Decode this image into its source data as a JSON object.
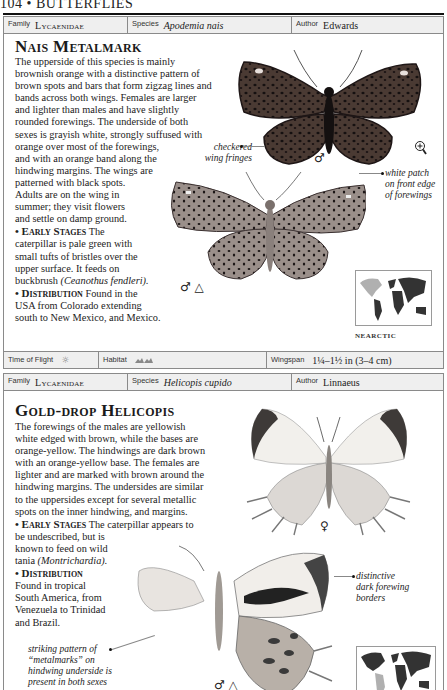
{
  "page": {
    "header": "104 • BUTTERFLIES"
  },
  "entries": [
    {
      "meta": {
        "family_label": "Family",
        "family": "Lycaenidae",
        "species_label": "Species",
        "species": "Apodemia nais",
        "author_label": "Author",
        "author": "Edwards"
      },
      "title": "Nais Metalmark",
      "description": [
        "The upperside of this species is mainly",
        "brownish orange with a distinctive pattern of",
        "brown spots and bars that form zigzag lines and",
        "bands across both wings. Females are larger",
        "and lighter than males and have slightly",
        "rounded forewings. The underside of both",
        "sexes is grayish white, strongly suffused with",
        "orange over most of the forewings,",
        "and with an orange band along the",
        "hindwing margins. The wings are",
        "patterned with black spots.",
        "Adults are on the wing in",
        "summer; they visit flowers",
        "and settle on damp ground."
      ],
      "early_stages": {
        "heading": "• Early Stages",
        "lines": [
          " The",
          "caterpillar is pale green with",
          "small tufts of bristles over the",
          "upper surface. It feeds on",
          "buckbrush "
        ],
        "italic": "(Ceanothus fendleri)."
      },
      "distribution": {
        "heading": "• Distribution",
        "lines": [
          " Found in the",
          "USA from Colorado extending",
          "south to New Mexico, and Mexico."
        ]
      },
      "annotations": {
        "wing_fringes": [
          "checkered",
          "wing fringes"
        ],
        "white_patch": [
          "white patch",
          "on front edge",
          "of forewings"
        ]
      },
      "symbols": {
        "upper": "♂",
        "lower": "♂ △",
        "magnify": "magnify-icon"
      },
      "map_label": "NEARCTIC",
      "footer": {
        "time_label": "Time of Flight",
        "time_icon": "☼",
        "habitat_label": "Habitat",
        "habitat_icon": "ᨏᨏ",
        "wingspan_label": "Wingspan",
        "wingspan": "1¼–1½ in (3–4 cm)"
      }
    },
    {
      "meta": {
        "family_label": "Family",
        "family": "Lycaenidae",
        "species_label": "Species",
        "species": "Helicopis cupido",
        "author_label": "Author",
        "author": "Linnaeus"
      },
      "title": "Gold-drop Helicopis",
      "description": [
        "The forewings of the males are yellowish",
        "white edged with brown, while the bases are",
        "orange-yellow. The hindwings are dark brown",
        "with an orange-yellow base. The females are",
        "lighter and are marked with brown around the",
        "hindwing margins. The undersides are similar",
        "to the uppersides except for several metallic",
        "spots on the inner hindwing, and margins."
      ],
      "early_stages": {
        "heading": "• Early Stages",
        "lines": [
          " The caterpillar appears to",
          "be undescribed, but is",
          "known to feed on wild",
          "tania "
        ],
        "italic": "(Montrichardia)."
      },
      "distribution": {
        "heading": "• Distribution",
        "lines": [
          "Found in tropical",
          "South America, from",
          "Venezuela to Trinidad",
          "and Brazil."
        ]
      },
      "annotations": {
        "forewing_borders": [
          "distinctive",
          "dark forewing",
          "borders"
        ],
        "metalmarks": [
          "striking pattern of",
          "“metalmarks” on",
          "hindwing underside is",
          "present in both sexes"
        ]
      },
      "symbols": {
        "upper": "♀",
        "lower": "♂ △"
      },
      "map_label": "NEOTROPICAL"
    }
  ]
}
